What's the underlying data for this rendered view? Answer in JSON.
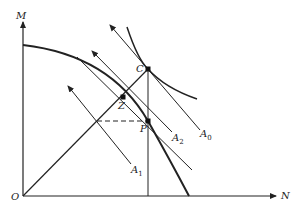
{
  "diagram": {
    "axes": {
      "y_label": "M",
      "x_label": "N",
      "origin_label": "O"
    },
    "points": {
      "C": "C",
      "Z": "Z",
      "P": "P"
    },
    "lines": [
      {
        "name": "A",
        "sub": "0"
      },
      {
        "name": "A",
        "sub": "1"
      },
      {
        "name": "A",
        "sub": "2"
      }
    ],
    "colors": {
      "ink": "#222222",
      "background": "#ffffff"
    }
  }
}
